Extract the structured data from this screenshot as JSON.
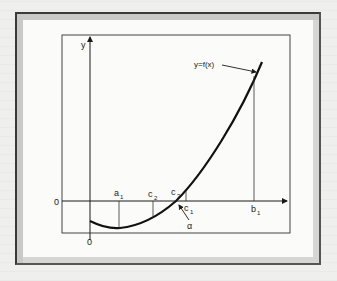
{
  "figure": {
    "curve_label": "y=f(x)",
    "axis_y_label": "y",
    "origin_y_label": "0",
    "origin_x_label": "0",
    "points": [
      {
        "name": "a",
        "sub": "1"
      },
      {
        "name": "c",
        "sub": "2"
      },
      {
        "name": "c",
        "sub": "3"
      },
      {
        "name": "c",
        "sub": "1"
      },
      {
        "name": "b",
        "sub": "1"
      }
    ],
    "root_label": "α"
  },
  "colors": {
    "line": "#1a1a1a",
    "frame_shadow": "#c9c9c7",
    "background": "#fbfbfa"
  }
}
